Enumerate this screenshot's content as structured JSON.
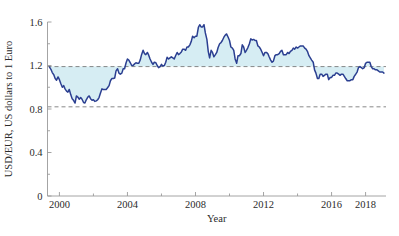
{
  "chart_data": {
    "type": "line",
    "title": "",
    "subtitle": "",
    "xlabel": "Year",
    "ylabel": "USD/EUR, US dollars to 1 Euro",
    "xlim": [
      1999.3,
      2019.2
    ],
    "ylim": [
      0,
      1.6
    ],
    "xticks": [
      2000,
      2004,
      2008,
      2012,
      2016,
      2018
    ],
    "xtick_labels": [
      "2000",
      "2004",
      "2008",
      "2012",
      "2016",
      "2018"
    ],
    "yticks": [
      0,
      0.4,
      0.8,
      1.2,
      1.6
    ],
    "ytick_labels": [
      "0",
      "0.4",
      "0.8",
      "1.2",
      "1.6"
    ],
    "yminorticks": [
      0.2,
      0.6,
      1.0,
      1.4
    ],
    "xminorticks": [
      2002,
      2006,
      2010,
      2014
    ],
    "grid": false,
    "legend": null,
    "legend_position": "none",
    "series": [
      {
        "name": "USD per 1 EUR",
        "color": "#2b3f91",
        "fill_color": "#d6edf3",
        "fill_baseline_upper": 1.19,
        "fill_baseline_lower": 0.82,
        "x": [
          1999.42,
          1999.5,
          1999.58,
          1999.67,
          1999.75,
          1999.83,
          1999.92,
          2000.0,
          2000.08,
          2000.17,
          2000.25,
          2000.33,
          2000.42,
          2000.5,
          2000.58,
          2000.67,
          2000.75,
          2000.83,
          2000.92,
          2001.0,
          2001.08,
          2001.17,
          2001.25,
          2001.33,
          2001.42,
          2001.5,
          2001.58,
          2001.67,
          2001.75,
          2001.83,
          2001.92,
          2002.0,
          2002.08,
          2002.17,
          2002.25,
          2002.33,
          2002.42,
          2002.5,
          2002.58,
          2002.67,
          2002.75,
          2002.83,
          2002.92,
          2003.0,
          2003.08,
          2003.17,
          2003.25,
          2003.33,
          2003.42,
          2003.5,
          2003.58,
          2003.67,
          2003.75,
          2003.83,
          2003.92,
          2004.0,
          2004.08,
          2004.17,
          2004.25,
          2004.33,
          2004.42,
          2004.5,
          2004.58,
          2004.67,
          2004.75,
          2004.83,
          2004.92,
          2005.0,
          2005.08,
          2005.17,
          2005.25,
          2005.33,
          2005.42,
          2005.5,
          2005.58,
          2005.67,
          2005.75,
          2005.83,
          2005.92,
          2006.0,
          2006.08,
          2006.17,
          2006.25,
          2006.33,
          2006.42,
          2006.5,
          2006.58,
          2006.67,
          2006.75,
          2006.83,
          2006.92,
          2007.0,
          2007.08,
          2007.17,
          2007.25,
          2007.33,
          2007.42,
          2007.5,
          2007.58,
          2007.67,
          2007.75,
          2007.83,
          2007.92,
          2008.0,
          2008.08,
          2008.17,
          2008.25,
          2008.33,
          2008.42,
          2008.5,
          2008.58,
          2008.67,
          2008.75,
          2008.83,
          2008.92,
          2009.0,
          2009.08,
          2009.17,
          2009.25,
          2009.33,
          2009.42,
          2009.5,
          2009.58,
          2009.67,
          2009.75,
          2009.83,
          2009.92,
          2010.0,
          2010.08,
          2010.17,
          2010.25,
          2010.33,
          2010.42,
          2010.5,
          2010.58,
          2010.67,
          2010.75,
          2010.83,
          2010.92,
          2011.0,
          2011.08,
          2011.17,
          2011.25,
          2011.33,
          2011.42,
          2011.5,
          2011.58,
          2011.67,
          2011.75,
          2011.83,
          2011.92,
          2012.0,
          2012.08,
          2012.17,
          2012.25,
          2012.33,
          2012.42,
          2012.5,
          2012.58,
          2012.67,
          2012.75,
          2012.83,
          2012.92,
          2013.0,
          2013.08,
          2013.17,
          2013.25,
          2013.33,
          2013.42,
          2013.5,
          2013.58,
          2013.67,
          2013.75,
          2013.83,
          2013.92,
          2014.0,
          2014.08,
          2014.17,
          2014.25,
          2014.33,
          2014.42,
          2014.5,
          2014.58,
          2014.67,
          2014.75,
          2014.83,
          2014.92,
          2015.0,
          2015.08,
          2015.17,
          2015.25,
          2015.33,
          2015.42,
          2015.5,
          2015.58,
          2015.67,
          2015.75,
          2015.83,
          2015.92,
          2016.0,
          2016.08,
          2016.17,
          2016.25,
          2016.33,
          2016.42,
          2016.5,
          2016.58,
          2016.67,
          2016.75,
          2016.83,
          2016.92,
          2017.0,
          2017.08,
          2017.17,
          2017.25,
          2017.33,
          2017.42,
          2017.5,
          2017.58,
          2017.67,
          2017.75,
          2017.83,
          2017.92,
          2018.0,
          2018.08,
          2018.17,
          2018.25,
          2018.33,
          2018.42,
          2018.5,
          2018.58,
          2018.67,
          2018.75,
          2018.83,
          2018.92,
          2019.0,
          2019.08
        ],
        "values": [
          1.185,
          1.165,
          1.135,
          1.115,
          1.08,
          1.065,
          1.095,
          1.07,
          1.035,
          1.0,
          1.015,
          0.985,
          0.965,
          0.955,
          0.98,
          0.93,
          0.895,
          0.88,
          0.855,
          0.92,
          0.91,
          0.89,
          0.905,
          0.89,
          0.86,
          0.855,
          0.885,
          0.91,
          0.92,
          0.895,
          0.88,
          0.885,
          0.87,
          0.875,
          0.885,
          0.905,
          0.95,
          0.985,
          0.98,
          0.98,
          0.98,
          0.995,
          1.015,
          1.06,
          1.08,
          1.08,
          1.085,
          1.15,
          1.17,
          1.13,
          1.12,
          1.13,
          1.17,
          1.17,
          1.225,
          1.26,
          1.25,
          1.225,
          1.2,
          1.2,
          1.215,
          1.225,
          1.22,
          1.22,
          1.25,
          1.3,
          1.34,
          1.31,
          1.3,
          1.32,
          1.295,
          1.26,
          1.23,
          1.21,
          1.23,
          1.225,
          1.2,
          1.18,
          1.19,
          1.21,
          1.195,
          1.2,
          1.23,
          1.275,
          1.26,
          1.27,
          1.28,
          1.27,
          1.26,
          1.29,
          1.32,
          1.3,
          1.31,
          1.325,
          1.35,
          1.35,
          1.34,
          1.37,
          1.37,
          1.39,
          1.42,
          1.47,
          1.455,
          1.47,
          1.47,
          1.55,
          1.575,
          1.555,
          1.555,
          1.575,
          1.5,
          1.44,
          1.33,
          1.27,
          1.34,
          1.32,
          1.28,
          1.3,
          1.32,
          1.365,
          1.4,
          1.41,
          1.43,
          1.46,
          1.48,
          1.49,
          1.46,
          1.43,
          1.37,
          1.36,
          1.34,
          1.26,
          1.22,
          1.29,
          1.29,
          1.31,
          1.39,
          1.37,
          1.32,
          1.34,
          1.365,
          1.4,
          1.445,
          1.435,
          1.44,
          1.43,
          1.43,
          1.38,
          1.37,
          1.35,
          1.32,
          1.29,
          1.32,
          1.32,
          1.31,
          1.28,
          1.25,
          1.23,
          1.24,
          1.29,
          1.3,
          1.3,
          1.31,
          1.33,
          1.34,
          1.3,
          1.3,
          1.3,
          1.32,
          1.31,
          1.33,
          1.34,
          1.36,
          1.35,
          1.37,
          1.36,
          1.37,
          1.38,
          1.38,
          1.38,
          1.36,
          1.35,
          1.33,
          1.29,
          1.27,
          1.25,
          1.23,
          1.16,
          1.13,
          1.08,
          1.08,
          1.12,
          1.12,
          1.1,
          1.11,
          1.12,
          1.12,
          1.07,
          1.09,
          1.09,
          1.11,
          1.11,
          1.13,
          1.13,
          1.12,
          1.11,
          1.12,
          1.12,
          1.1,
          1.08,
          1.06,
          1.06,
          1.06,
          1.07,
          1.07,
          1.1,
          1.12,
          1.14,
          1.18,
          1.19,
          1.18,
          1.17,
          1.18,
          1.22,
          1.23,
          1.23,
          1.23,
          1.19,
          1.17,
          1.17,
          1.16,
          1.16,
          1.15,
          1.14,
          1.14,
          1.14,
          1.13
        ]
      }
    ],
    "annotations": [
      {
        "name": "upper-reference-line",
        "type": "hline",
        "value": 1.19,
        "style": "dashed"
      },
      {
        "name": "lower-reference-line",
        "type": "hline",
        "value": 0.82,
        "style": "dashed"
      }
    ]
  }
}
